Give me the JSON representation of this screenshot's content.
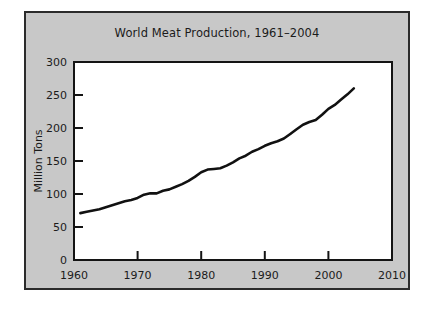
{
  "figure": {
    "background_color": "#ffffff",
    "panel_color": "#c8c8c8",
    "panel_border_color": "#2b2b2b",
    "plot_background_color": "#ffffff",
    "axis_color": "#141414",
    "line_color": "#111111"
  },
  "chart_data": {
    "type": "line",
    "title": "World Meat Production, 1961–2004",
    "subtitle": "",
    "xlabel": "",
    "ylabel": "Million Tons",
    "xlim": [
      1960,
      2010
    ],
    "ylim": [
      0,
      300
    ],
    "xticks": [
      1960,
      1970,
      1980,
      1990,
      2000,
      2010
    ],
    "xticklabels": [
      "1960",
      "1970",
      "1980",
      "1990",
      "2000",
      "2010"
    ],
    "yticks": [
      0,
      50,
      100,
      150,
      200,
      250,
      300
    ],
    "yticklabels": [
      "0",
      "50",
      "100",
      "150",
      "200",
      "250",
      "300"
    ],
    "grid": false,
    "legend": false,
    "legend_position": "none",
    "series": [
      {
        "name": "World Meat Production",
        "units": "Million Tons",
        "x": [
          1961,
          1962,
          1963,
          1964,
          1965,
          1966,
          1967,
          1968,
          1969,
          1970,
          1971,
          1972,
          1973,
          1974,
          1975,
          1976,
          1977,
          1978,
          1979,
          1980,
          1981,
          1982,
          1983,
          1984,
          1985,
          1986,
          1987,
          1988,
          1989,
          1990,
          1991,
          1992,
          1993,
          1994,
          1995,
          1996,
          1997,
          1998,
          1999,
          2000,
          2001,
          2002,
          2003,
          2004
        ],
        "values": [
          71,
          73,
          75,
          77,
          80,
          83,
          86,
          89,
          91,
          94,
          99,
          101,
          101,
          105,
          107,
          111,
          115,
          120,
          126,
          133,
          137,
          138,
          139,
          143,
          148,
          154,
          158,
          164,
          168,
          173,
          177,
          180,
          184,
          191,
          198,
          205,
          209,
          212,
          220,
          229,
          235,
          243,
          251,
          260
        ]
      }
    ]
  }
}
